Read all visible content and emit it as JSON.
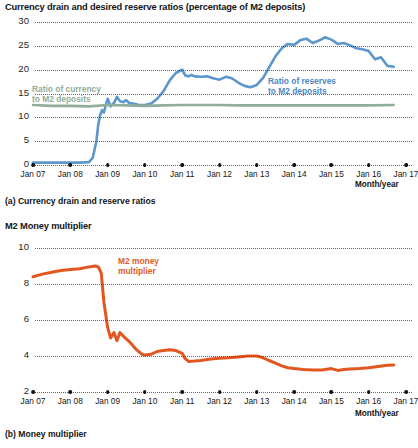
{
  "figure": {
    "panel_a": {
      "title": "Currency drain and desired reserve ratios (percentage of M2 deposits)",
      "caption": "(a) Currency drain and reserve ratios",
      "axis_unit_label": "Month/year",
      "label_currency": "Ratio of currency\nto M2 deposits",
      "label_currency_line1": "Ratio of currency",
      "label_currency_line2": "to M2 deposits",
      "label_reserves_line1": "Ratio of reserves",
      "label_reserves_line2": "to M2 deposits"
    },
    "panel_b": {
      "title": "M2 Money multiplier",
      "caption": "(b) Money multiplier",
      "axis_unit_label": "Month/year",
      "label_multiplier_line1": "M2 money",
      "label_multiplier_line2": "multiplier"
    }
  },
  "colors": {
    "reserves_blue": "#5b96cc",
    "currency_green": "#8fad99",
    "multiplier_orange": "#e2561f",
    "grid": "#4a4a4a",
    "text": "#141414"
  },
  "chart_data": [
    {
      "type": "line",
      "id": "panel-a",
      "title": "Currency drain and desired reserve ratios (percentage of M2 deposits)",
      "caption": "(a) Currency drain and reserve ratios",
      "xlabel": "Month/year",
      "ylabel": "Percentage of M2 deposits",
      "grid": true,
      "legend": "inline-annotation",
      "xlim": [
        2007.0,
        2017.0
      ],
      "ylim": [
        0,
        30
      ],
      "yticks": [
        0,
        5,
        10,
        15,
        20,
        25,
        30
      ],
      "xticks": [
        "Jan 07",
        "Jan 08",
        "Jan 09",
        "Jan 10",
        "Jan 11",
        "Jan 12",
        "Jan 13",
        "Jan 14",
        "Jan 15",
        "Jan 16",
        "Jan 17"
      ],
      "xtick_values": [
        2007,
        2008,
        2009,
        2010,
        2011,
        2012,
        2013,
        2014,
        2015,
        2016,
        2017
      ],
      "series": [
        {
          "name": "Ratio of reserves to M2 deposits",
          "color": "#5b96cc",
          "x": [
            2007.0,
            2007.25,
            2007.5,
            2007.75,
            2008.0,
            2008.25,
            2008.5,
            2008.6,
            2008.7,
            2008.75,
            2008.8,
            2008.85,
            2008.9,
            2008.95,
            2009.0,
            2009.08,
            2009.17,
            2009.25,
            2009.33,
            2009.42,
            2009.5,
            2009.58,
            2009.67,
            2009.75,
            2009.83,
            2009.92,
            2010.0,
            2010.17,
            2010.33,
            2010.5,
            2010.67,
            2010.83,
            2011.0,
            2011.08,
            2011.17,
            2011.25,
            2011.33,
            2011.5,
            2011.67,
            2011.83,
            2012.0,
            2012.17,
            2012.33,
            2012.5,
            2012.67,
            2012.83,
            2013.0,
            2013.17,
            2013.33,
            2013.5,
            2013.67,
            2013.83,
            2014.0,
            2014.17,
            2014.33,
            2014.5,
            2014.67,
            2014.83,
            2015.0,
            2015.17,
            2015.33,
            2015.5,
            2015.67,
            2015.83,
            2016.0,
            2016.17,
            2016.33,
            2016.5,
            2016.67
          ],
          "y": [
            0.5,
            0.5,
            0.5,
            0.5,
            0.5,
            0.5,
            0.6,
            1.5,
            5.0,
            8.5,
            10.5,
            11.5,
            11.0,
            12.5,
            13.9,
            12.3,
            13.0,
            14.3,
            13.4,
            13.2,
            13.6,
            13.0,
            12.9,
            12.8,
            12.6,
            12.6,
            12.6,
            12.9,
            13.9,
            15.5,
            17.8,
            19.3,
            20.0,
            18.8,
            18.6,
            18.9,
            18.6,
            18.5,
            18.6,
            18.2,
            17.9,
            18.5,
            18.2,
            17.3,
            16.6,
            16.3,
            16.8,
            18.3,
            20.5,
            22.8,
            24.5,
            25.4,
            25.2,
            26.2,
            26.5,
            25.6,
            26.1,
            26.8,
            26.3,
            25.4,
            25.6,
            25.1,
            24.5,
            24.3,
            23.9,
            22.2,
            22.6,
            20.8,
            20.6
          ]
        },
        {
          "name": "Ratio of currency to M2 deposits",
          "color": "#8fad99",
          "x": [
            2007.0,
            2007.5,
            2008.0,
            2008.5,
            2009.0,
            2009.5,
            2010.0,
            2010.5,
            2011.0,
            2011.5,
            2012.0,
            2012.5,
            2013.0,
            2013.5,
            2014.0,
            2014.5,
            2015.0,
            2015.5,
            2016.0,
            2016.67
          ],
          "y": [
            12.6,
            12.4,
            12.4,
            12.3,
            12.6,
            12.5,
            12.4,
            12.5,
            12.6,
            12.6,
            12.6,
            12.5,
            12.5,
            12.5,
            12.5,
            12.5,
            12.5,
            12.5,
            12.5,
            12.6
          ]
        }
      ]
    },
    {
      "type": "line",
      "id": "panel-b",
      "title": "M2 Money multiplier",
      "caption": "(b) Money multiplier",
      "xlabel": "Month/year",
      "ylabel": "M2 Money multiplier",
      "grid": true,
      "xlim": [
        2007.0,
        2017.0
      ],
      "ylim": [
        2,
        10
      ],
      "yticks": [
        2,
        4,
        6,
        8,
        10
      ],
      "xticks": [
        "Jan 07",
        "Jan 08",
        "Jan 09",
        "Jan 10",
        "Jan 11",
        "Jan 12",
        "Jan 13",
        "Jan 14",
        "Jan 15",
        "Jan 16",
        "Jan 17"
      ],
      "xtick_values": [
        2007,
        2008,
        2009,
        2010,
        2011,
        2012,
        2013,
        2014,
        2015,
        2016,
        2017
      ],
      "series": [
        {
          "name": "M2 money multiplier",
          "color": "#e2561f",
          "x": [
            2007.0,
            2007.25,
            2007.5,
            2007.75,
            2008.0,
            2008.25,
            2008.5,
            2008.67,
            2008.75,
            2008.83,
            2008.9,
            2009.0,
            2009.08,
            2009.17,
            2009.25,
            2009.33,
            2009.42,
            2009.5,
            2009.58,
            2009.67,
            2009.75,
            2009.83,
            2009.92,
            2010.0,
            2010.17,
            2010.33,
            2010.5,
            2010.67,
            2010.83,
            2011.0,
            2011.08,
            2011.17,
            2011.33,
            2011.5,
            2011.67,
            2011.83,
            2012.0,
            2012.25,
            2012.5,
            2012.75,
            2013.0,
            2013.17,
            2013.33,
            2013.5,
            2013.67,
            2013.83,
            2014.0,
            2014.25,
            2014.5,
            2014.75,
            2015.0,
            2015.17,
            2015.33,
            2015.5,
            2015.75,
            2016.0,
            2016.25,
            2016.5,
            2016.67
          ],
          "y": [
            8.4,
            8.55,
            8.65,
            8.75,
            8.8,
            8.85,
            8.95,
            9.0,
            8.95,
            8.6,
            7.0,
            5.6,
            5.0,
            5.3,
            4.85,
            5.3,
            5.1,
            4.95,
            4.8,
            4.6,
            4.4,
            4.25,
            4.1,
            4.05,
            4.1,
            4.25,
            4.3,
            4.35,
            4.3,
            4.15,
            3.85,
            3.7,
            3.72,
            3.75,
            3.8,
            3.85,
            3.88,
            3.9,
            3.95,
            4.0,
            4.0,
            3.9,
            3.75,
            3.6,
            3.45,
            3.35,
            3.3,
            3.25,
            3.22,
            3.22,
            3.3,
            3.2,
            3.25,
            3.28,
            3.3,
            3.35,
            3.42,
            3.48,
            3.5
          ]
        }
      ]
    }
  ]
}
